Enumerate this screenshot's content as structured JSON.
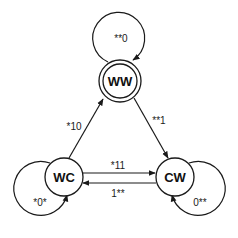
{
  "diagram": {
    "type": "state-machine",
    "nodes": [
      {
        "id": "WW",
        "label": "WW",
        "accepting": true
      },
      {
        "id": "WC",
        "label": "WC",
        "accepting": false
      },
      {
        "id": "CW",
        "label": "CW",
        "accepting": false
      }
    ],
    "edges": [
      {
        "from": "WW",
        "to": "WW",
        "label": "**0"
      },
      {
        "from": "WC",
        "to": "WW",
        "label": "*10"
      },
      {
        "from": "WW",
        "to": "CW",
        "label": "**1"
      },
      {
        "from": "WC",
        "to": "CW",
        "label": "*11"
      },
      {
        "from": "CW",
        "to": "WC",
        "label": "1**"
      },
      {
        "from": "WC",
        "to": "WC",
        "label": "*0*"
      },
      {
        "from": "CW",
        "to": "CW",
        "label": "0**"
      }
    ]
  },
  "colors": {
    "stroke": "#1a1a1a",
    "background": "#ffffff"
  }
}
